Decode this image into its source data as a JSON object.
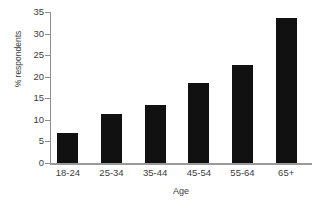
{
  "chart_data": {
    "type": "bar",
    "title": "",
    "subtitle": "",
    "xlabel": "Age",
    "ylabel": "% respondents",
    "categories": [
      "18-24",
      "25-34",
      "35-44",
      "45-54",
      "55-64",
      "65+"
    ],
    "values": [
      7.0,
      11.3,
      13.5,
      18.5,
      22.7,
      33.5
    ],
    "series": [
      {
        "name": "% respondents",
        "values": [
          7.0,
          11.3,
          13.5,
          18.5,
          22.7,
          33.5
        ]
      }
    ],
    "ylim": [
      0,
      35
    ],
    "ytick_labels": [
      "0",
      "5",
      "10",
      "15",
      "20",
      "25",
      "30",
      "35"
    ],
    "ytick_values": [
      0,
      5,
      10,
      15,
      20,
      25,
      30,
      35
    ],
    "grid": false,
    "legend": false,
    "legend_position": "none",
    "annotations": [],
    "colors": {
      "bar": "#111111",
      "axis": "#9a9a9a",
      "text": "#3c3c3c",
      "background": "#ffffff"
    }
  }
}
